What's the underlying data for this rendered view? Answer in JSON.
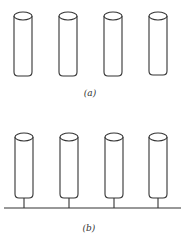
{
  "figure": {
    "panels": [
      {
        "id": "a",
        "label": "(a)",
        "cylinders": 4,
        "base_line": false
      },
      {
        "id": "b",
        "label": "(b)",
        "cylinders": 4,
        "base_line": true
      }
    ],
    "colors": {
      "line": "#333333",
      "background": "#ffffff"
    }
  }
}
